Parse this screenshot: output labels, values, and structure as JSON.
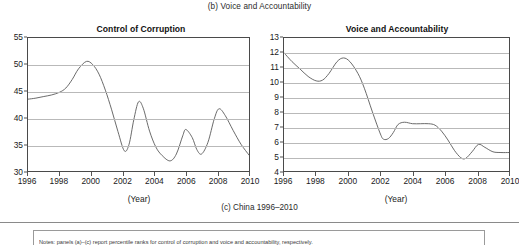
{
  "top_caption": "(b) Voice and Accountability",
  "bottom_caption": "(c) China 1996–2010",
  "note_text": "Notes: panels (a)–(c) report percentile ranks for control of corruption and voice and accountability, respectively.",
  "axis_caption": "(Year)",
  "colors": {
    "line": "#5a5a5a",
    "grid": "#b9b9b9",
    "axis": "#4a4a4a",
    "text": "#1a1a1a"
  },
  "chart_data": [
    {
      "type": "line",
      "id": "control-of-corruption",
      "title": "Control of Corruption",
      "xlabel": "(Year)",
      "ylabel": "",
      "xlim": [
        1996,
        2010
      ],
      "ylim": [
        30,
        55
      ],
      "ytick_step": 5,
      "grid": true,
      "legend": "none",
      "xticks": [
        1996,
        1998,
        2000,
        2002,
        2004,
        2006,
        2008,
        2010
      ],
      "xticklabels": [
        "1996",
        "1998",
        "2000",
        "2002",
        "2004",
        "2006",
        "2008",
        "2010"
      ],
      "yticks": [
        30,
        35,
        40,
        45,
        50,
        55
      ],
      "yticklabels": [
        "30",
        "35",
        "40",
        "45",
        "50",
        "55"
      ],
      "series": [
        {
          "name": "Control of Corruption",
          "x": [
            1996,
            1996.5,
            1997,
            1997.5,
            1998,
            1998.4,
            1998.8,
            1999.2,
            1999.7,
            2000.1,
            2000.5,
            2000.9,
            2001.3,
            2001.7,
            2002.1,
            2002.4,
            2002.7,
            2003.0,
            2003.3,
            2003.7,
            2004.1,
            2004.5,
            2005.0,
            2005.4,
            2005.8,
            2006.0,
            2006.4,
            2006.7,
            2007.0,
            2007.4,
            2007.8,
            2008.1,
            2008.5,
            2009.0,
            2009.5,
            2010
          ],
          "values": [
            43.5,
            43.7,
            44.0,
            44.3,
            44.8,
            45.6,
            47.2,
            49.2,
            50.6,
            50.0,
            48.2,
            45.2,
            41.5,
            37.4,
            33.8,
            35.0,
            39.6,
            43.0,
            41.8,
            37.5,
            34.5,
            32.9,
            31.9,
            33.2,
            36.6,
            37.8,
            36.3,
            34.0,
            33.2,
            35.4,
            39.8,
            41.7,
            40.4,
            37.6,
            35.0,
            33.0
          ]
        }
      ]
    },
    {
      "type": "line",
      "id": "voice-and-accountability",
      "title": "Voice and Accountability",
      "xlabel": "(Year)",
      "ylabel": "",
      "xlim": [
        1996,
        2010
      ],
      "ylim": [
        4,
        13
      ],
      "ytick_step": 1,
      "grid": true,
      "legend": "none",
      "xticks": [
        1996,
        1998,
        2000,
        2002,
        2004,
        2006,
        2008,
        2010
      ],
      "xticklabels": [
        "1996",
        "1998",
        "2000",
        "2002",
        "2004",
        "2006",
        "2008",
        "2010"
      ],
      "yticks": [
        4,
        5,
        6,
        7,
        8,
        9,
        10,
        11,
        12,
        13
      ],
      "yticklabels": [
        "4",
        "5",
        "6",
        "7",
        "8",
        "9",
        "10",
        "11",
        "12",
        "13"
      ],
      "series": [
        {
          "name": "Voice and Accountability",
          "x": [
            1996,
            1996.5,
            1997,
            1997.5,
            1998,
            1998.4,
            1998.8,
            1999.3,
            1999.7,
            2000.1,
            2000.6,
            2001.0,
            2001.5,
            2002.0,
            2002.2,
            2002.5,
            2002.8,
            2003.1,
            2003.5,
            2004.0,
            2004.5,
            2005.0,
            2005.4,
            2005.8,
            2006.2,
            2006.6,
            2007.0,
            2007.3,
            2007.7,
            2008.1,
            2008.5,
            2009.0,
            2009.5,
            2010
          ],
          "values": [
            12.0,
            11.4,
            10.9,
            10.4,
            10.1,
            10.15,
            10.6,
            11.4,
            11.65,
            11.4,
            10.6,
            9.6,
            8.0,
            6.5,
            6.15,
            6.2,
            6.6,
            7.15,
            7.3,
            7.2,
            7.2,
            7.2,
            7.1,
            6.7,
            6.1,
            5.4,
            4.9,
            4.85,
            5.3,
            5.8,
            5.6,
            5.3,
            5.25,
            5.25
          ]
        }
      ]
    }
  ]
}
